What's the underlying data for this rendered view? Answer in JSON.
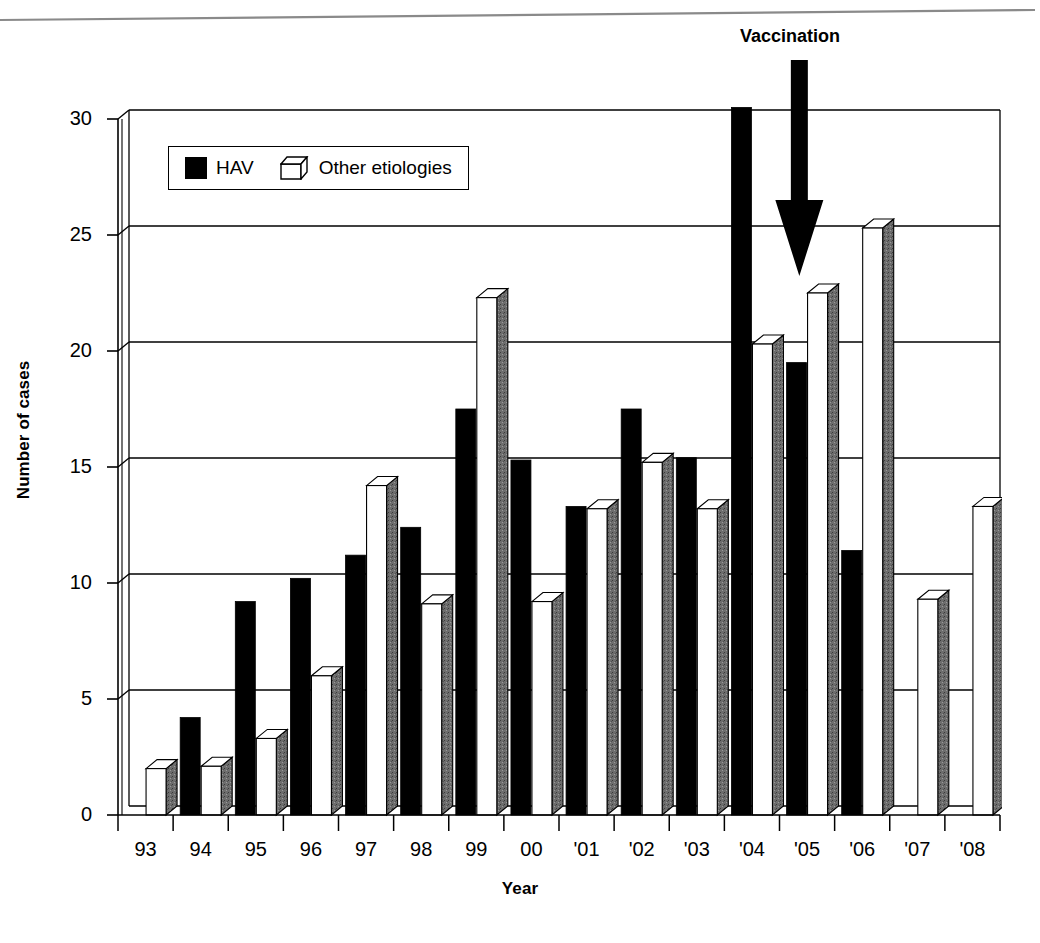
{
  "annotation": {
    "label": "Vaccination",
    "type": "down-arrow",
    "points_to_year": "'05"
  },
  "legend": {
    "position": "inside-top-left",
    "entries": [
      {
        "label": "HAV",
        "swatch": "black-square",
        "color": "#000000"
      },
      {
        "label": "Other etiologies",
        "swatch": "white-3d-cube",
        "color": "#ffffff"
      }
    ]
  },
  "chart_data": {
    "type": "bar",
    "title": "",
    "subtitle": "",
    "xlabel": "Year",
    "ylabel": "Number of cases",
    "ylim": [
      0,
      30
    ],
    "yticks": [
      0,
      5,
      10,
      15,
      20,
      25,
      30
    ],
    "grid": "horizontal",
    "legend_position": "inside-top-left",
    "note": "1993 and 2007-2008 have no HAV bar; the 2004 HAV bar is clipped at the top of the axis.",
    "categories": [
      "93",
      "94",
      "95",
      "96",
      "97",
      "98",
      "99",
      "00",
      "'01",
      "'02",
      "'03",
      "'04",
      "'05",
      "'06",
      "'07",
      "'08"
    ],
    "series": [
      {
        "name": "HAV",
        "color": "#000000",
        "values": [
          0,
          4.2,
          9.2,
          10.2,
          11.2,
          12.4,
          17.5,
          15.3,
          13.3,
          17.5,
          15.4,
          30.5,
          19.5,
          11.4,
          0,
          0
        ]
      },
      {
        "name": "Other etiologies",
        "color": "#ffffff",
        "values": [
          2.0,
          2.1,
          3.3,
          6.0,
          14.2,
          9.1,
          22.3,
          9.2,
          13.2,
          15.2,
          13.2,
          20.3,
          22.5,
          25.3,
          9.3,
          13.3
        ]
      }
    ]
  }
}
